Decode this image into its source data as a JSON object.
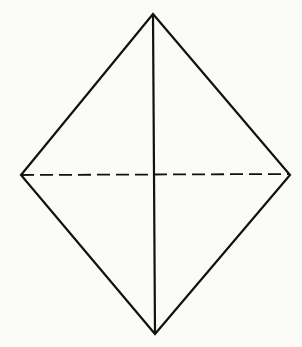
{
  "diagram": {
    "shape": "rhombus",
    "background": "#fbfbf8",
    "stroke": "#111111",
    "vertices": {
      "top": [
        153,
        14
      ],
      "right": [
        290,
        175
      ],
      "bottom": [
        155,
        334
      ],
      "left": [
        21,
        175
      ]
    },
    "vertical_diagonal": {
      "style": "solid"
    },
    "horizontal_diagonal": {
      "style": "dashed",
      "dash": "13 6"
    }
  }
}
